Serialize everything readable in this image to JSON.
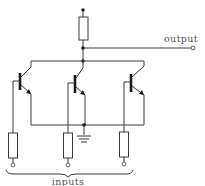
{
  "diagram": {
    "type": "circuit-schematic",
    "labels": {
      "output": "output",
      "inputs": "inputs"
    },
    "components": {
      "pullup_resistor": {
        "count": 1
      },
      "transistors": [
        {
          "id": "Q1",
          "type": "npn"
        },
        {
          "id": "Q2",
          "type": "npn"
        },
        {
          "id": "Q3",
          "type": "npn"
        }
      ],
      "input_resistors": [
        {
          "id": "R1",
          "input": "input-1"
        },
        {
          "id": "R2",
          "input": "input-2"
        },
        {
          "id": "R3",
          "input": "input-3"
        }
      ],
      "ground": {
        "count": 1
      },
      "terminals": [
        "output",
        "input-1",
        "input-2",
        "input-3"
      ]
    },
    "colors": {
      "wire": "#3a3a3a",
      "text": "#555555",
      "background": "#ffffff"
    }
  }
}
